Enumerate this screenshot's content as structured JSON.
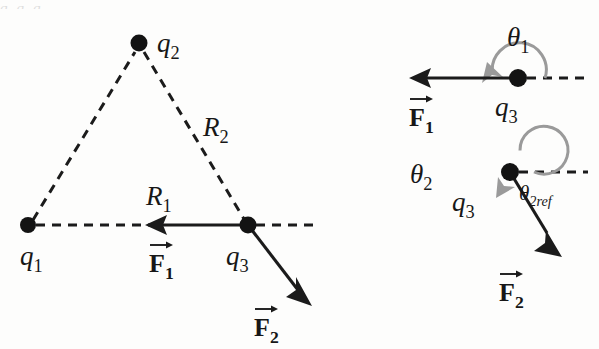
{
  "figure": {
    "background_color": "#fdfdfc",
    "ink_color": "#1b1b1b",
    "arc_color": "#9a9a9a",
    "clipped_top_text": "q₁            q₂  q"
  },
  "left_panel": {
    "name": "charge-configuration",
    "charges": [
      {
        "id": "q1",
        "label": "q",
        "sub": "1",
        "x": 28,
        "y": 225
      },
      {
        "id": "q2",
        "label": "q",
        "sub": "2",
        "x": 139,
        "y": 43
      },
      {
        "id": "q3",
        "label": "q",
        "sub": "3",
        "x": 248,
        "y": 225
      }
    ],
    "distances": [
      {
        "id": "R1",
        "label": "R",
        "sub": "1",
        "from": "q1",
        "to": "q3",
        "x": 152,
        "y": 196
      },
      {
        "id": "R2",
        "label": "R",
        "sub": "2",
        "from": "q2",
        "to": "q3",
        "x": 212,
        "y": 127
      }
    ],
    "forces": [
      {
        "id": "F1",
        "label": "F",
        "sub": "1",
        "description": "force on q3 from q1, pointing left along the q1-q3 axis",
        "x1": 248,
        "y1": 225,
        "x2": 150,
        "y2": 225,
        "label_x": 162,
        "label_y": 268
      },
      {
        "id": "F2",
        "label": "F",
        "sub": "2",
        "description": "force on q3 from q2, pointing down and to the right",
        "x1": 248,
        "y1": 225,
        "x2": 308,
        "y2": 303,
        "label_x": 266,
        "label_y": 332
      }
    ],
    "reference_axis": {
      "name": "horizontal-reference-dashed",
      "x1": 248,
      "y1": 225,
      "x2": 320,
      "y2": 225
    },
    "triangle_sides_dashed": [
      {
        "from": "q1",
        "to": "q2"
      },
      {
        "from": "q2",
        "to": "q3"
      },
      {
        "from": "q1",
        "to": "q3"
      }
    ]
  },
  "right_panel_top": {
    "name": "theta1-angle-diagram",
    "charge": {
      "id": "q3",
      "label": "q",
      "sub": "3",
      "x": 518,
      "y": 78
    },
    "angle": {
      "id": "theta1",
      "label": "θ",
      "sub": "1",
      "label_x": 520,
      "label_y": 38,
      "value_description": "180 degrees, measured counterclockwise from the +x reference axis to F1",
      "arc_radius": 27,
      "arc_start_deg": 0,
      "arc_end_deg": 172,
      "direction": "counterclockwise"
    },
    "force": {
      "id": "F1",
      "label": "F",
      "sub": "1",
      "x1": 518,
      "y1": 78,
      "x2": 412,
      "y2": 78,
      "label_x": 424,
      "label_y": 122
    },
    "reference_axis": {
      "name": "horizontal-reference-dashed",
      "x1": 518,
      "y1": 78,
      "x2": 588,
      "y2": 78
    }
  },
  "right_panel_bottom": {
    "name": "theta2-angle-diagram",
    "charge": {
      "id": "q3",
      "label": "q",
      "sub": "3",
      "x": 510,
      "y": 172,
      "label_x": 466,
      "label_y": 212
    },
    "angle_main": {
      "id": "theta2",
      "label": "θ",
      "sub": "2",
      "label_x": 424,
      "label_y": 176,
      "value_description": "reflex angle measured counterclockwise from the +x reference axis around to F2",
      "arc_radius": 24,
      "arc_start_deg": 0,
      "arc_end_deg": 290,
      "direction": "counterclockwise"
    },
    "angle_reference": {
      "id": "theta2ref",
      "label": "θ",
      "sub": "2ref",
      "label_x": 523,
      "label_y": 202,
      "value_description": "reference (acute) angle between the +x axis and F2"
    },
    "force": {
      "id": "F2",
      "label": "F",
      "sub": "2",
      "x1": 510,
      "y1": 172,
      "x2": 560,
      "y2": 254,
      "label_x": 512,
      "label_y": 300
    },
    "reference_axis": {
      "name": "horizontal-reference-dashed",
      "x1": 510,
      "y1": 172,
      "x2": 588,
      "y2": 172
    }
  }
}
